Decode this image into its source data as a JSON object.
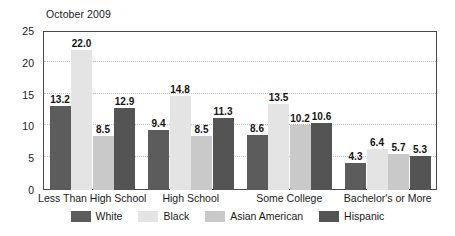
{
  "chart_data": {
    "type": "bar",
    "title": "October 2009",
    "xlabel": "",
    "ylabel": "",
    "ylim": [
      0,
      25
    ],
    "yticks": [
      0,
      5,
      10,
      15,
      20,
      25
    ],
    "ytick_labels": [
      "0",
      "5",
      "10",
      "15",
      "20",
      "25"
    ],
    "grid": true,
    "grid_style": "dotted horizontal",
    "legend_position": "bottom-center",
    "categories": [
      "Less Than High School",
      "High School",
      "Some College",
      "Bachelor's or More"
    ],
    "series": [
      {
        "name": "White",
        "color": "#5c5c5c",
        "values": [
          13.2,
          9.4,
          8.6,
          4.3
        ],
        "labels": [
          "13.2",
          "9.4",
          "8.6",
          "4.3"
        ]
      },
      {
        "name": "Black",
        "color": "#e4e4e4",
        "values": [
          22.0,
          14.8,
          13.5,
          6.4
        ],
        "labels": [
          "22.0",
          "14.8",
          "13.5",
          "6.4"
        ]
      },
      {
        "name": "Asian American",
        "color": "#c9c9c9",
        "values": [
          8.5,
          8.5,
          10.2,
          5.7
        ],
        "labels": [
          "8.5",
          "8.5",
          "10.2",
          "5.7"
        ]
      },
      {
        "name": "Hispanic",
        "color": "#545454",
        "values": [
          12.9,
          11.3,
          10.6,
          5.3
        ],
        "labels": [
          "12.9",
          "11.3",
          "10.6",
          "5.3"
        ]
      }
    ]
  },
  "style": {
    "plot_border_color": "#4a4a4a",
    "gridline_color": "#bdbdbd",
    "text_color": "#1a1a1a",
    "background": "#ffffff"
  }
}
